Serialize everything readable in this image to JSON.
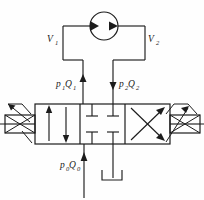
{
  "diagram": {
    "type": "hydraulic-schematic",
    "background_color": "#fefefe",
    "line_color": "#1c1c1c",
    "labels": {
      "v1": {
        "base": "V",
        "subscript": "1",
        "full": "V1"
      },
      "v2": {
        "base": "V",
        "subscript": "2",
        "full": "V2"
      },
      "p1q1": {
        "p": "p",
        "p_sub": "1",
        "q": "Q",
        "q_sub": "1",
        "full": "p1Q1"
      },
      "p2q2": {
        "p": "p",
        "p_sub": "2",
        "q": "Q",
        "q_sub": "2",
        "full": "p2Q2"
      },
      "p0q0": {
        "p": "p",
        "p_sub": "0",
        "q": "Q",
        "q_sub": "0",
        "full": "p0Q0"
      }
    },
    "components": {
      "pump": {
        "name": "pump-motor",
        "shape": "circle",
        "cx": 104,
        "cy": 26,
        "r": 14,
        "arrow_count": 2,
        "arrow_direction": "right"
      },
      "valve": {
        "name": "four-three-way-directional-valve",
        "x": 35,
        "y": 104,
        "width": 135,
        "height": 40,
        "positions": 3,
        "position_labels": [
          "parallel-flow",
          "closed-center",
          "crossed-flow"
        ]
      },
      "actuator_left": {
        "name": "solenoid-actuator-left",
        "x": 5,
        "y": 115,
        "width": 30,
        "height": 18
      },
      "actuator_right": {
        "name": "solenoid-actuator-right",
        "x": 170,
        "y": 115,
        "width": 30,
        "height": 18
      },
      "port_a": {
        "name": "port-a-line",
        "x": 83,
        "y_top": 60,
        "y_bottom": 104
      },
      "port_b": {
        "name": "port-b-line",
        "x": 113,
        "y_top": 60,
        "y_bottom": 104
      },
      "port_p": {
        "name": "pressure-supply-line",
        "x": 84,
        "y_top": 144,
        "y_bottom": 198
      },
      "port_t": {
        "name": "tank-return-line",
        "x": 113,
        "y_top": 144,
        "y_bottom": 178
      }
    }
  }
}
